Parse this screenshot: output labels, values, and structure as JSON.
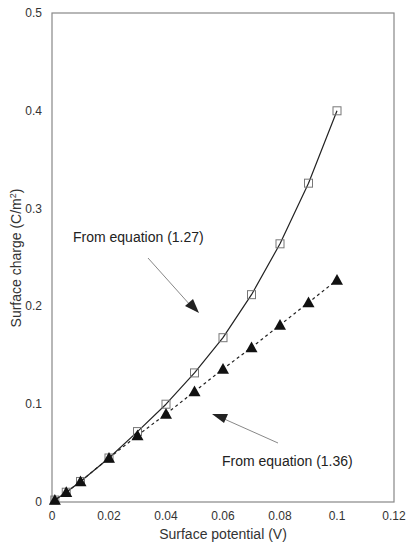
{
  "chart_data": {
    "type": "line",
    "title": "",
    "xlabel": "Surface potential (V)",
    "ylabel": "Surface charge (C/m²)",
    "ylabel_parts": {
      "main": "Surface charge (C/m",
      "sup": "2",
      "end": ")"
    },
    "xlim": [
      0,
      0.12
    ],
    "ylim": [
      0,
      0.5
    ],
    "x_ticks": [
      "0",
      "0.02",
      "0.04",
      "0.06",
      "0.08",
      "0.1",
      "0.12"
    ],
    "y_ticks": [
      "0",
      "0.1",
      "0.2",
      "0.3",
      "0.4",
      "0.5"
    ],
    "grid": false,
    "legend": null,
    "series": [
      {
        "name": "From equation (1.27)",
        "marker": "open-square",
        "line": "solid",
        "x": [
          0.001,
          0.005,
          0.01,
          0.02,
          0.03,
          0.04,
          0.05,
          0.06,
          0.07,
          0.08,
          0.09,
          0.1
        ],
        "values": [
          0.002,
          0.01,
          0.021,
          0.045,
          0.072,
          0.1,
          0.132,
          0.168,
          0.212,
          0.264,
          0.326,
          0.4
        ]
      },
      {
        "name": "From equation (1.36)",
        "marker": "filled-triangle",
        "line": "dashed",
        "x": [
          0.001,
          0.005,
          0.01,
          0.02,
          0.03,
          0.04,
          0.05,
          0.06,
          0.07,
          0.08,
          0.09,
          0.1
        ],
        "values": [
          0.002,
          0.01,
          0.021,
          0.045,
          0.068,
          0.09,
          0.113,
          0.136,
          0.158,
          0.181,
          0.204,
          0.227
        ]
      }
    ],
    "annotations": [
      {
        "text": "From equation (1.27)",
        "target_series": 0
      },
      {
        "text": "From equation (1.36)",
        "target_series": 1
      }
    ]
  },
  "colors": {
    "axis": "#888888",
    "line": "#222222",
    "marker_fill": "#111111",
    "square_stroke": "#777777",
    "arrow": "#888888"
  }
}
